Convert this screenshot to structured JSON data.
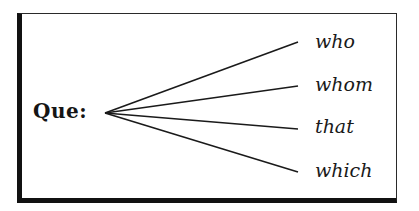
{
  "diagram": {
    "root_label": "Que:",
    "branches": [
      {
        "label": "who"
      },
      {
        "label": "whom"
      },
      {
        "label": "that"
      },
      {
        "label": "which"
      }
    ],
    "line_color": "#1a1a1a"
  }
}
